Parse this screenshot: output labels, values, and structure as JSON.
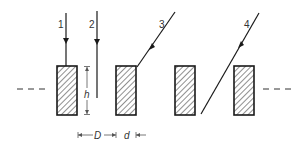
{
  "diagram": {
    "type": "grating-ray-diagram",
    "line_color": "#1a1a1a",
    "hatch_color": "#333333",
    "rays": [
      {
        "label": "1",
        "description": "vertical ray hitting top of plate 1"
      },
      {
        "label": "2",
        "description": "vertical ray passing through gap"
      },
      {
        "label": "3",
        "description": "oblique ray hitting top corner of plate 2"
      },
      {
        "label": "4",
        "description": "oblique ray passing through gap between plates 3 and 4"
      }
    ],
    "plates": [
      {
        "index": 1,
        "hatched": true
      },
      {
        "index": 2,
        "hatched": true
      },
      {
        "index": 3,
        "hatched": true
      },
      {
        "index": 4,
        "hatched": true
      }
    ],
    "dimensions": {
      "height": "h",
      "spacing": "D",
      "width": "d"
    },
    "continuation": {
      "left": "- - -",
      "right": "- - -"
    }
  }
}
